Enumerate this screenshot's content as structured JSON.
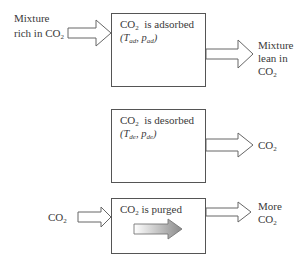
{
  "stages": [
    {
      "id": "adsorption",
      "title": {
        "pre": "CO",
        "sub": "2",
        "post": "  is adsorbed"
      },
      "conditions": {
        "T": "T",
        "T_sub": "ad",
        "p": "p",
        "p_sub": "ad"
      },
      "input_label": {
        "line1": "Mixture",
        "line2_pre": "rich in CO",
        "line2_sub": "2"
      },
      "output_label": {
        "line1": "Mixture",
        "line2": "lean in",
        "line3_pre": "CO",
        "line3_sub": "2"
      },
      "inner_icon": "curved-arrow-down-icon"
    },
    {
      "id": "desorption",
      "title": {
        "pre": "CO",
        "sub": "2",
        "post": "  is desorbed"
      },
      "conditions": {
        "T": "T",
        "T_sub": "de",
        "p": "p",
        "p_sub": "de"
      },
      "output_label": {
        "pre": "CO",
        "sub": "2"
      },
      "inner_icon": "curved-arrow-up-icon"
    },
    {
      "id": "purge",
      "title": {
        "pre": "CO",
        "sub": "2",
        "post": " is purged"
      },
      "input_label": {
        "pre": "CO",
        "sub": "2"
      },
      "output_label": {
        "line1": "More",
        "line2_pre": "CO",
        "line2_sub": "2"
      },
      "inner_icon": "gradient-arrow-right-icon"
    }
  ],
  "colors": {
    "stroke": "#555555",
    "arrow_fill": "#ffffff",
    "curved_fill": "#c8c8c8",
    "gradient_start": "#ffffff",
    "gradient_end": "#8a8a8a"
  }
}
